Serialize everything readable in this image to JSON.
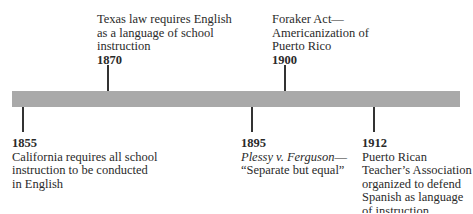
{
  "timeline": {
    "bar_color": "#a9a9a9",
    "events": [
      {
        "year": "1855",
        "position": "below",
        "lines": [
          "California requires all school",
          "instruction to be conducted",
          "in English"
        ]
      },
      {
        "year": "1870",
        "position": "above",
        "lines": [
          "Texas law requires English",
          "as a language of school",
          "instruction"
        ]
      },
      {
        "year": "1895",
        "position": "below",
        "lines_italic_part": "Plessy v. Ferguson",
        "lines": [
          "—",
          "“Separate but equal”"
        ]
      },
      {
        "year": "1900",
        "position": "above",
        "lines": [
          "Foraker Act—",
          "Americanization of",
          "Puerto Rico"
        ]
      },
      {
        "year": "1912",
        "position": "below",
        "lines": [
          "Puerto Rican",
          "Teacher’s Association",
          "organized to defend",
          "Spanish as language",
          "of instruction"
        ]
      }
    ]
  }
}
